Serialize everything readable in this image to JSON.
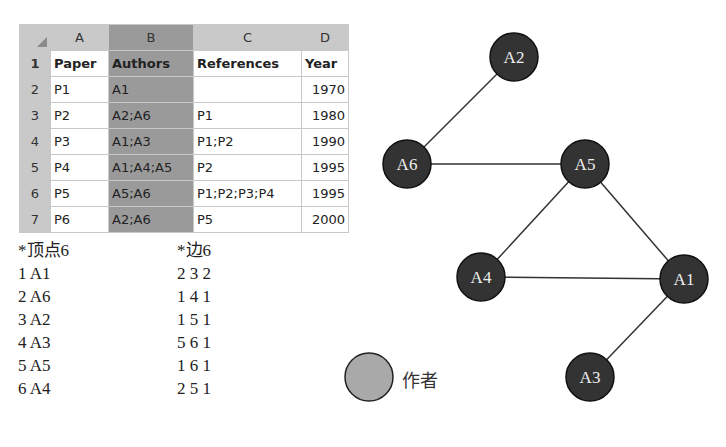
{
  "spreadsheet": {
    "columns": [
      "A",
      "B",
      "C",
      "D"
    ],
    "selected_column": "B",
    "header_row": {
      "row": "1",
      "cells": [
        "Paper",
        "Authors",
        "References",
        "Year"
      ]
    },
    "rows": [
      {
        "row": "2",
        "cells": [
          "P1",
          "A1",
          "",
          "1970"
        ]
      },
      {
        "row": "3",
        "cells": [
          "P2",
          "A2;A6",
          "P1",
          "1980"
        ]
      },
      {
        "row": "4",
        "cells": [
          "P3",
          "A1;A3",
          "P1;P2",
          "1990"
        ]
      },
      {
        "row": "5",
        "cells": [
          "P4",
          "A1;A4;A5",
          "P2",
          "1995"
        ]
      },
      {
        "row": "6",
        "cells": [
          "P5",
          "A5;A6",
          "P1;P2;P3;P4",
          "1995"
        ]
      },
      {
        "row": "7",
        "cells": [
          "P6",
          "A2;A6",
          "P5",
          "2000"
        ]
      }
    ]
  },
  "vertices_list": {
    "header": "*顶点6",
    "items": [
      "1 A1",
      "2 A6",
      "3 A2",
      "4 A3",
      "5 A5",
      "6 A4"
    ]
  },
  "edges_list": {
    "header": "*边6",
    "items": [
      "2 3 2",
      "1 4 1",
      "1 5 1",
      "5 6 1",
      "1 6 1",
      "2 5 1"
    ]
  },
  "graph": {
    "node_color": "#333333",
    "nodes": [
      {
        "id": "A2",
        "label": "A2",
        "x": 514,
        "y": 57
      },
      {
        "id": "A6",
        "label": "A6",
        "x": 407,
        "y": 164
      },
      {
        "id": "A5",
        "label": "A5",
        "x": 585,
        "y": 164
      },
      {
        "id": "A4",
        "label": "A4",
        "x": 481,
        "y": 277
      },
      {
        "id": "A1",
        "label": "A1",
        "x": 684,
        "y": 279
      },
      {
        "id": "A3",
        "label": "A3",
        "x": 590,
        "y": 377
      }
    ],
    "edges": [
      [
        "A2",
        "A6"
      ],
      [
        "A6",
        "A5"
      ],
      [
        "A5",
        "A4"
      ],
      [
        "A5",
        "A1"
      ],
      [
        "A4",
        "A1"
      ],
      [
        "A1",
        "A3"
      ]
    ]
  },
  "legend": {
    "label": "作者",
    "color": "#a9a9a9"
  }
}
